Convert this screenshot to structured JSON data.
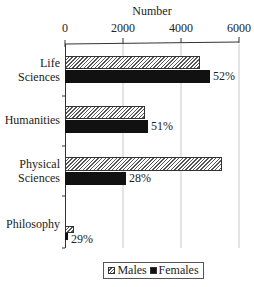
{
  "chart_data": {
    "type": "bar",
    "orientation": "horizontal",
    "title": "",
    "xlabel": "Number",
    "ylabel": "",
    "xlim": [
      0,
      6000
    ],
    "x_ticks": [
      "0",
      "2000",
      "4000",
      "6000"
    ],
    "axis_position": "top",
    "grid": true,
    "categories": [
      "Life Sciences",
      "Humanities",
      "Physical Sciences",
      "Philosophy"
    ],
    "category_labels": [
      [
        "Life",
        "Sciences"
      ],
      [
        "Humanities"
      ],
      [
        "Physical",
        "Sciences"
      ],
      [
        "Philosophy"
      ]
    ],
    "series": [
      {
        "name": "Males",
        "pattern": "hatched",
        "values": [
          4650,
          2750,
          5400,
          300
        ]
      },
      {
        "name": "Females",
        "pattern": "solid-black",
        "values": [
          5000,
          2850,
          2100,
          100
        ]
      }
    ],
    "annotations": [
      "52%",
      "51%",
      "28%",
      "29%"
    ],
    "annotation_note": "Percentages shown next to Females bars",
    "legend": {
      "position": "bottom",
      "entries": [
        "Males",
        "Females"
      ]
    }
  },
  "layout": {
    "x0_px": 65,
    "px_per_unit": 0.029
  }
}
